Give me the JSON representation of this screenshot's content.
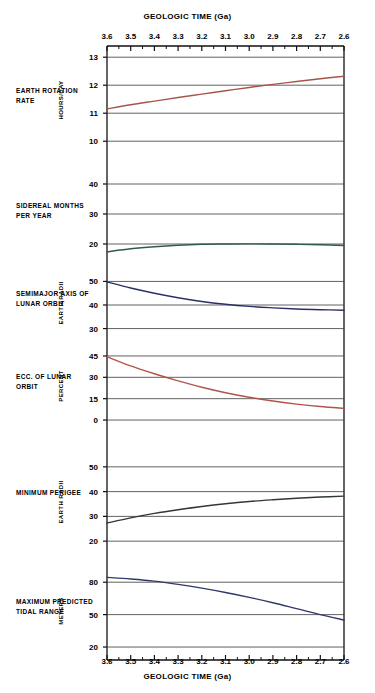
{
  "figure": {
    "top_axis_title": "GEOLOGIC TIME (Ga)",
    "bottom_axis_title": "GEOLOGIC TIME (Ga)",
    "x_tick_labels": [
      "3.6",
      "3.5",
      "3.4",
      "3.3",
      "3.2",
      "3.1",
      "3.0",
      "2.9",
      "2.8",
      "2.7",
      "2.6"
    ]
  },
  "chart_data": {
    "type": "line",
    "title": "GEOLOGIC TIME (Ga)",
    "xlabel": "GEOLOGIC TIME (Ga)",
    "xlim": [
      3.6,
      2.6
    ],
    "x_reversed": true,
    "x_ticks": [
      3.6,
      3.5,
      3.4,
      3.3,
      3.2,
      3.1,
      3.0,
      2.9,
      2.8,
      2.7,
      2.6
    ],
    "x_minor_tick_step": 0.05,
    "grid": true,
    "legend": "none",
    "panels": [
      {
        "name": "earth-rotation-rate",
        "label": "EARTH ROTATION RATE",
        "ylabel": "HOURS/DAY",
        "ylim": [
          9.4,
          13.4
        ],
        "y_ticks": [
          10,
          11,
          12,
          13
        ],
        "color": "#a8544a",
        "x": [
          3.6,
          3.5,
          3.4,
          3.3,
          3.2,
          3.1,
          3.0,
          2.9,
          2.8,
          2.7,
          2.6
        ],
        "values": [
          11.15,
          11.3,
          11.43,
          11.56,
          11.68,
          11.8,
          11.92,
          12.03,
          12.13,
          12.23,
          12.32
        ]
      },
      {
        "name": "sidereal-months-per-year",
        "label": "SIDEREAL MONTHS PER YEAR",
        "ylabel": "",
        "ylim": [
          14,
          44
        ],
        "y_ticks": [
          20,
          30,
          40
        ],
        "color": "#2f5c4c",
        "x": [
          3.6,
          3.5,
          3.4,
          3.3,
          3.2,
          3.1,
          3.0,
          2.9,
          2.8,
          2.7,
          2.6
        ],
        "values": [
          17.4,
          18.4,
          19.1,
          19.6,
          19.9,
          20.0,
          20.05,
          20.0,
          19.9,
          19.75,
          19.5
        ]
      },
      {
        "name": "semimajor-axis-of-lunar-orbit",
        "label": "SEMIMAJOR AXIS OF LUNAR ORBIT",
        "ylabel": "EARTH RADII",
        "ylim": [
          26,
          54
        ],
        "y_ticks": [
          30,
          40,
          50
        ],
        "color": "#2b2f66",
        "x": [
          3.6,
          3.5,
          3.4,
          3.3,
          3.2,
          3.1,
          3.0,
          2.9,
          2.8,
          2.7,
          2.6
        ],
        "values": [
          49.8,
          47.2,
          45.0,
          43.1,
          41.5,
          40.3,
          39.4,
          38.8,
          38.3,
          38.0,
          37.8
        ]
      },
      {
        "name": "ecc-of-lunar-orbit",
        "label": "ECC. OF LUNAR ORBIT",
        "ylabel": "PERCENT",
        "ylim": [
          -7,
          52
        ],
        "y_ticks": [
          0,
          15,
          30,
          45
        ],
        "color": "#b3544b",
        "x": [
          3.6,
          3.5,
          3.4,
          3.3,
          3.2,
          3.1,
          3.0,
          2.9,
          2.8,
          2.7,
          2.6
        ],
        "values": [
          44.5,
          38.0,
          32.5,
          27.5,
          23.0,
          19.2,
          16.0,
          13.4,
          11.2,
          9.5,
          8.2
        ]
      },
      {
        "name": "minimum-perigee",
        "label": "MINIMUM PERIGEE",
        "ylabel": "EARTH RADII",
        "ylim": [
          14,
          56
        ],
        "y_ticks": [
          20,
          30,
          40,
          50
        ],
        "color": "#303a33",
        "x": [
          3.6,
          3.5,
          3.4,
          3.3,
          3.2,
          3.1,
          3.0,
          2.9,
          2.8,
          2.7,
          2.6
        ],
        "values": [
          27.3,
          29.4,
          31.2,
          32.7,
          34.0,
          35.1,
          36.0,
          36.7,
          37.3,
          37.8,
          38.2
        ]
      },
      {
        "name": "maximum-predicted-tidal-range",
        "label": "MAXIMUM PREDICTED TIDAL RANGE",
        "ylabel": "METERS",
        "ylim": [
          8,
          95
        ],
        "y_ticks": [
          20,
          50,
          80
        ],
        "color": "#31386b",
        "x": [
          3.6,
          3.5,
          3.4,
          3.3,
          3.2,
          3.1,
          3.0,
          2.9,
          2.8,
          2.7,
          2.6
        ],
        "values": [
          84.5,
          83.0,
          81.0,
          78.0,
          74.5,
          70.5,
          66.0,
          61.0,
          55.5,
          50.0,
          45.0
        ]
      }
    ]
  }
}
